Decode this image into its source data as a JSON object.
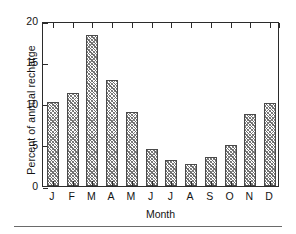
{
  "chart_data": {
    "type": "bar",
    "title": "",
    "xlabel": "Month",
    "ylabel": "Percent of annual recharge",
    "categories": [
      "J",
      "F",
      "M",
      "A",
      "M",
      "J",
      "J",
      "A",
      "S",
      "O",
      "N",
      "D"
    ],
    "values": [
      10.2,
      11.3,
      18.3,
      12.8,
      9.0,
      4.5,
      3.2,
      2.7,
      3.5,
      5.0,
      8.7,
      10.1
    ],
    "ylim": [
      0,
      20
    ],
    "yticks": [
      0,
      5,
      10,
      15,
      20
    ],
    "ytick_labels": [
      "0",
      "5",
      "10",
      "15",
      "20"
    ],
    "grid": false,
    "legend": null,
    "bar_fill": "#8a8a8a",
    "bar_edge": "#4a4a4a",
    "axis_color": "#2b2b2b",
    "background": "#ffffff"
  },
  "figure": {
    "rule_color": "#6a6a6a"
  }
}
